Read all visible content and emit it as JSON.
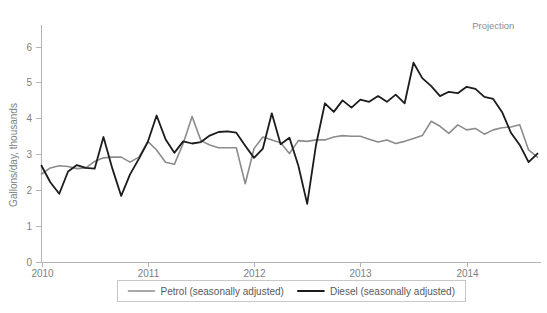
{
  "chart_data": {
    "type": "line",
    "title": "",
    "xlabel": "",
    "ylabel": "Gallons/day, thousands",
    "ylim": [
      0,
      6.6
    ],
    "yticks": [
      0,
      1,
      2,
      3,
      4,
      5,
      6
    ],
    "ytick_labels": [
      "0",
      "1",
      "2",
      "3",
      "4",
      "5",
      "6"
    ],
    "xlim": [
      2010.0,
      2014.7
    ],
    "xticks": [
      2010,
      2011,
      2012,
      2013,
      2014
    ],
    "xtick_labels": [
      "2010",
      "2011",
      "2012",
      "2013",
      "2014"
    ],
    "grid": false,
    "legend_position": "bottom-center",
    "annotations": [
      {
        "text": "Projection",
        "x": 2014.45,
        "y": 6.5
      }
    ],
    "series": [
      {
        "name": "Petrol (seasonally adjusted)",
        "color": "#8c8c8c",
        "width": 1.6,
        "x": [
          2010.0,
          2010.083,
          2010.167,
          2010.25,
          2010.333,
          2010.417,
          2010.5,
          2010.583,
          2010.667,
          2010.75,
          2010.833,
          2010.917,
          2011.0,
          2011.083,
          2011.167,
          2011.25,
          2011.333,
          2011.417,
          2011.5,
          2011.583,
          2011.667,
          2011.75,
          2011.833,
          2011.917,
          2012.0,
          2012.083,
          2012.167,
          2012.25,
          2012.333,
          2012.417,
          2012.5,
          2012.583,
          2012.667,
          2012.75,
          2012.833,
          2012.917,
          2013.0,
          2013.083,
          2013.167,
          2013.25,
          2013.333,
          2013.417,
          2013.5,
          2013.583,
          2013.667,
          2013.75,
          2013.833,
          2013.917,
          2014.0,
          2014.083,
          2014.167,
          2014.25,
          2014.333,
          2014.417,
          2014.5,
          2014.583,
          2014.667
        ],
        "values": [
          2.45,
          2.62,
          2.68,
          2.66,
          2.6,
          2.62,
          2.8,
          2.9,
          2.92,
          2.92,
          2.78,
          2.92,
          3.36,
          3.12,
          2.78,
          2.72,
          3.3,
          4.05,
          3.38,
          3.26,
          3.18,
          3.18,
          3.18,
          2.18,
          3.16,
          3.48,
          3.4,
          3.32,
          3.02,
          3.38,
          3.36,
          3.4,
          3.4,
          3.48,
          3.52,
          3.5,
          3.5,
          3.42,
          3.34,
          3.4,
          3.3,
          3.36,
          3.44,
          3.52,
          3.92,
          3.78,
          3.58,
          3.82,
          3.68,
          3.72,
          3.56,
          3.68,
          3.74,
          3.76,
          3.82,
          3.12,
          2.92
        ]
      },
      {
        "name": "Diesel (seasonally adjusted)",
        "color": "#1c1c1c",
        "width": 1.8,
        "x": [
          2010.0,
          2010.083,
          2010.167,
          2010.25,
          2010.333,
          2010.417,
          2010.5,
          2010.583,
          2010.667,
          2010.75,
          2010.833,
          2010.917,
          2011.0,
          2011.083,
          2011.167,
          2011.25,
          2011.333,
          2011.417,
          2011.5,
          2011.583,
          2011.667,
          2011.75,
          2011.833,
          2011.917,
          2012.0,
          2012.083,
          2012.167,
          2012.25,
          2012.333,
          2012.417,
          2012.5,
          2012.583,
          2012.667,
          2012.75,
          2012.833,
          2012.917,
          2013.0,
          2013.083,
          2013.167,
          2013.25,
          2013.333,
          2013.417,
          2013.5,
          2013.583,
          2013.667,
          2013.75,
          2013.833,
          2013.917,
          2014.0,
          2014.083,
          2014.167,
          2014.25,
          2014.333,
          2014.417,
          2014.5,
          2014.583,
          2014.667
        ],
        "values": [
          2.68,
          2.22,
          1.9,
          2.52,
          2.7,
          2.62,
          2.6,
          3.48,
          2.6,
          1.84,
          2.44,
          2.88,
          3.34,
          4.08,
          3.42,
          3.04,
          3.36,
          3.3,
          3.34,
          3.52,
          3.62,
          3.64,
          3.6,
          3.24,
          2.9,
          3.16,
          4.14,
          3.28,
          3.46,
          2.68,
          1.62,
          3.26,
          4.42,
          4.18,
          4.5,
          4.3,
          4.52,
          4.46,
          4.62,
          4.46,
          4.66,
          4.42,
          5.55,
          5.12,
          4.9,
          4.62,
          4.74,
          4.7,
          4.88,
          4.82,
          4.6,
          4.54,
          4.18,
          3.6,
          3.26,
          2.78,
          3.02
        ]
      }
    ]
  }
}
